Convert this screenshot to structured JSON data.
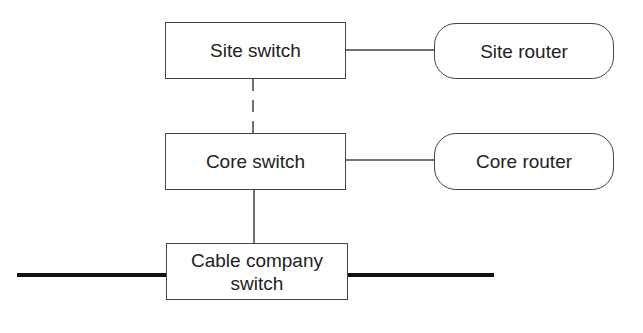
{
  "diagram": {
    "nodes": {
      "site_switch": {
        "label": "Site switch",
        "shape": "rectangle"
      },
      "site_router": {
        "label": "Site router",
        "shape": "rounded-rectangle"
      },
      "core_switch": {
        "label": "Core switch",
        "shape": "rectangle"
      },
      "core_router": {
        "label": "Core router",
        "shape": "rounded-rectangle"
      },
      "cable_switch": {
        "label": "Cable company\nswitch",
        "shape": "rectangle"
      }
    },
    "edges": [
      {
        "from": "site_switch",
        "to": "site_router",
        "style": "solid"
      },
      {
        "from": "site_switch",
        "to": "core_switch",
        "style": "dashed"
      },
      {
        "from": "core_switch",
        "to": "core_router",
        "style": "solid"
      },
      {
        "from": "core_switch",
        "to": "cable_switch",
        "style": "solid"
      },
      {
        "from": "cable_switch",
        "to": "backbone",
        "style": "thick"
      }
    ],
    "colors": {
      "line": "#444444",
      "background": "#ffffff",
      "text": "#222222"
    }
  }
}
